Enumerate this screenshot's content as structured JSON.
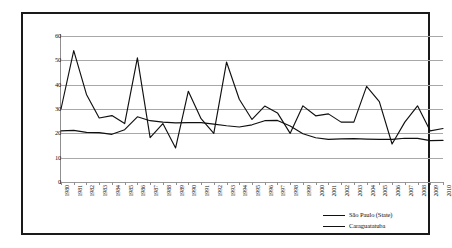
{
  "chart_data": {
    "type": "line",
    "title": "",
    "subtitle": "",
    "xlabel": "",
    "ylabel": "",
    "ylim": [
      0,
      60
    ],
    "ytick_labels": [
      "60",
      "50",
      "40",
      "30",
      "20",
      "10",
      "0"
    ],
    "ytick_values": [
      60,
      50,
      40,
      30,
      20,
      10,
      0
    ],
    "grid": true,
    "legend_position": "bottom-right",
    "categories": [
      "1980",
      "1981",
      "1982",
      "1983",
      "1984",
      "1985",
      "1986",
      "1987",
      "1988",
      "1989",
      "1990",
      "1991",
      "1992",
      "1993",
      "1994",
      "1995",
      "1996",
      "1997",
      "1998",
      "1999",
      "2000",
      "2001",
      "2002",
      "2003",
      "2004",
      "2005",
      "2006",
      "2007",
      "2008",
      "2009",
      "2010"
    ],
    "series": [
      {
        "name": "São Paulo (State)",
        "color": "#101010",
        "values": [
          21.0,
          21.2,
          20.4,
          20.3,
          19.6,
          21.5,
          26.8,
          25.2,
          24.6,
          24.3,
          24.4,
          24.4,
          23.8,
          23.1,
          22.6,
          23.5,
          25.2,
          25.3,
          23.0,
          19.8,
          18.2,
          17.5,
          17.7,
          17.8,
          17.6,
          17.5,
          17.5,
          18.0,
          17.9,
          17.0,
          17.1
        ]
      },
      {
        "name": "Caraguatatuba",
        "color": "#101010",
        "values": [
          30.0,
          54.0,
          36.0,
          26.3,
          27.3,
          24.0,
          51.0,
          18.2,
          24.0,
          14.0,
          37.3,
          26.0,
          20.0,
          49.3,
          34.0,
          25.7,
          31.2,
          28.4,
          20.0,
          31.3,
          27.2,
          28.0,
          24.6,
          24.6,
          39.3,
          33.0,
          15.6,
          24.6,
          31.3,
          21.0,
          22.0
        ]
      }
    ]
  },
  "legend": {
    "entries": [
      {
        "label": "São Paulo (State)"
      },
      {
        "label": "Caraguatatuba"
      }
    ]
  },
  "colors": {
    "line": "#101010",
    "gridline": "#a8a8a8",
    "frame": "#1a1a1a",
    "background": "#ffffff"
  }
}
